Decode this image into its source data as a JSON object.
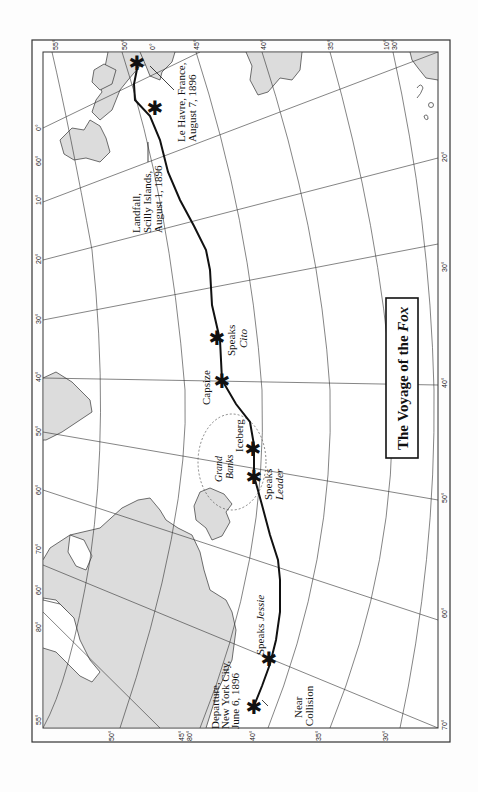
{
  "title": {
    "prefix": "The Voyage of the ",
    "ship": "Fox"
  },
  "colors": {
    "land": "#dcdcdc",
    "route": "#111111",
    "grid": "#333333",
    "background": "#fdfdfd"
  },
  "events": [
    {
      "id": "departure",
      "lines": [
        "Departure,",
        "New York City,",
        "June 6, 1896"
      ]
    },
    {
      "id": "near-collision",
      "lines": [
        "Near",
        "Collision"
      ]
    },
    {
      "id": "speaks-jessie",
      "text": "Speaks ",
      "ship": "Jessie"
    },
    {
      "id": "speaks-leader",
      "text": "Speaks",
      "ship": "Leader"
    },
    {
      "id": "grand-banks",
      "lines": [
        "Grand",
        "Banks"
      ]
    },
    {
      "id": "iceberg",
      "text": "Iceberg"
    },
    {
      "id": "capsize",
      "text": "Capsize"
    },
    {
      "id": "speaks-cito",
      "text": "Speaks",
      "ship": "Cito"
    },
    {
      "id": "landfall",
      "lines": [
        "Landfall,",
        "Scilly Islands,",
        "August 1, 1896"
      ]
    },
    {
      "id": "le-havre",
      "lines": [
        "Le Havre, France,",
        "August 7, 1896"
      ]
    }
  ],
  "ticks": {
    "top": [
      "55°",
      "50°",
      "0°",
      "45°",
      "40°",
      "35°",
      "10°",
      "30°"
    ],
    "left": [
      "0°",
      "60°",
      "10°",
      "20°",
      "30°",
      "40°",
      "50°",
      "60°",
      "70°",
      "60°",
      "80°",
      "55°"
    ],
    "bottom": [
      "50°",
      "45°",
      "80°",
      "40°",
      "35°",
      "30°"
    ],
    "right": [
      "20°",
      "30°",
      "40°",
      "50°",
      "60°",
      "70°"
    ]
  }
}
